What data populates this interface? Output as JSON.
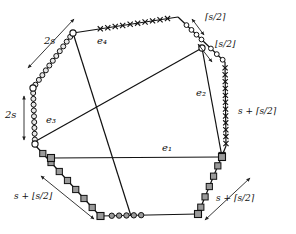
{
  "figure": {
    "shape": "octagon",
    "title": "",
    "edge_labels": {
      "e1": "e₁",
      "e2": "e₂",
      "e3": "e₃",
      "e4": "e₄"
    },
    "annotations": {
      "top_left_2s": "2s",
      "left_2s": "2s",
      "top_right_ceil": "⌈s/2⌉",
      "right_upper_floor": "⌊s/2⌋",
      "right_side": "s + ⌈s/2⌉",
      "bottom_left": "s + ⌊s/2⌋",
      "bottom_right": "s + ⌈s/2⌉"
    },
    "colors": {
      "stroke": "#111111",
      "marker_fill_light": "#e8e8e8",
      "marker_fill_gray": "#9a9a9a",
      "background": "#ffffff"
    },
    "marker_types": {
      "cross": "x-marker",
      "circle": "circle-marker",
      "square": "square-marker"
    },
    "vertices": [
      {
        "name": "v-top-left",
        "x": 73,
        "y": 33
      },
      {
        "name": "v-top-right",
        "x": 178,
        "y": 17
      },
      {
        "name": "v-right-upper",
        "x": 225,
        "y": 62
      },
      {
        "name": "v-right-lower",
        "x": 226,
        "y": 146
      },
      {
        "name": "v-bottom-right",
        "x": 198,
        "y": 214
      },
      {
        "name": "v-bottom-left",
        "x": 100,
        "y": 216
      },
      {
        "name": "v-left-lower",
        "x": 35,
        "y": 145
      },
      {
        "name": "v-left-upper",
        "x": 33,
        "y": 88
      }
    ],
    "chords": [
      {
        "name": "e1",
        "from": "v-left-lower-sq",
        "to": "v-right-lower-sq"
      },
      {
        "name": "e2",
        "from": "v-right-upper-mid",
        "to": "v-bottom-right"
      },
      {
        "name": "e3",
        "from": "v-left-upper-circ",
        "to": "v-right-upper-mid"
      },
      {
        "name": "e4",
        "from": "v-top-left",
        "to": "v-bottom-mid"
      }
    ]
  }
}
